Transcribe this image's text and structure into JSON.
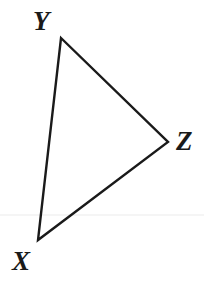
{
  "figure": {
    "kind": "geometry-triangle-diagram",
    "background_color": "#ffffff",
    "stroke_color": "#1a1a1a",
    "stroke_width": 2.4,
    "label_color": "#1a1a1a",
    "canvas": {
      "width": 204,
      "height": 293
    },
    "vertices": [
      {
        "id": "Y",
        "label": "Y",
        "x": 61,
        "y": 38
      },
      {
        "id": "Z",
        "label": "Z",
        "x": 168,
        "y": 142
      },
      {
        "id": "X",
        "label": "X",
        "x": 38,
        "y": 240
      }
    ],
    "edges": [
      {
        "from": "Y",
        "to": "Z"
      },
      {
        "from": "Z",
        "to": "X"
      },
      {
        "from": "X",
        "to": "Y"
      }
    ],
    "labels": {
      "y_label": "Y",
      "z_label": "Z",
      "x_label": "X"
    },
    "guide_line": {
      "visible": true,
      "color": "#f2f2f2",
      "y": 215
    }
  }
}
